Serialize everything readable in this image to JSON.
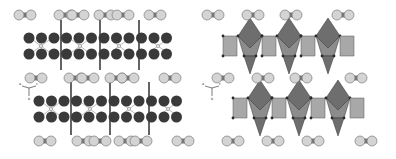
{
  "figure": {
    "panels": [
      {
        "id": "ball-and-stick",
        "style": "ball-stick",
        "axis_labels": {
          "a": "a",
          "b": "b",
          "c": "c"
        }
      },
      {
        "id": "polyhedral",
        "style": "polyhedra",
        "axis_labels": {
          "a": "a",
          "b": "b",
          "c": "c"
        }
      }
    ],
    "colors": {
      "dark_atom": "#3a3a3a",
      "light_atom": "#d4d4d4",
      "light_atom_stroke": "#6a6a6a",
      "linker": "#7a7a7a",
      "octahedron_dark": "#6e6e6e",
      "octahedron_mid": "#8c8c8c",
      "octahedron_light": "#a8a8a8",
      "vertex": "#2a2a2a"
    }
  }
}
